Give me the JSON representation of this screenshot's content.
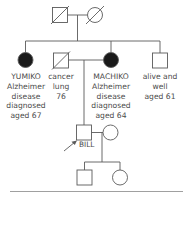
{
  "diagram": {
    "type": "family-pedigree",
    "colors": {
      "line": "#5a5a5a",
      "affected_fill": "#1a1a1a",
      "text": "#4a4a4a"
    },
    "generation_1": [
      {
        "sex": "male",
        "status": "deceased",
        "affected": false
      },
      {
        "sex": "female",
        "status": "deceased",
        "affected": false
      }
    ],
    "generation_2": [
      {
        "sex": "female",
        "affected": true,
        "label_lines": [
          "YUMIKO",
          "Alzheimer",
          "disease",
          "diagnosed",
          "aged 67"
        ]
      },
      {
        "sex": "male",
        "status": "deceased",
        "affected": false,
        "label_lines": [
          "cancer",
          "lung",
          "76"
        ]
      },
      {
        "sex": "female",
        "affected": true,
        "label_lines": [
          "MACHIKO",
          "Alzheimer",
          "disease",
          "diagnosed",
          "aged 64"
        ]
      },
      {
        "sex": "male",
        "affected": false,
        "label_lines": [
          "alive and",
          "well",
          "aged 61"
        ]
      }
    ],
    "generation_3": [
      {
        "sex": "male",
        "proband": true,
        "label": "BILL"
      },
      {
        "sex": "female",
        "spouse": true
      }
    ],
    "generation_4": [
      {
        "sex": "male"
      },
      {
        "sex": "female"
      }
    ]
  }
}
